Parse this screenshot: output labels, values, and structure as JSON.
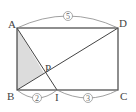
{
  "diagram": {
    "type": "geometry",
    "shape": "rectangle",
    "vertices": {
      "A": {
        "label": "A",
        "x": 17,
        "y": 28
      },
      "D": {
        "label": "D",
        "x": 118,
        "y": 28
      },
      "B": {
        "label": "B",
        "x": 17,
        "y": 90
      },
      "C": {
        "label": "C",
        "x": 118,
        "y": 90
      },
      "I": {
        "label": "I",
        "x": 57,
        "y": 90
      },
      "P": {
        "label": "P",
        "x": 44,
        "y": 73
      }
    },
    "segments": [
      "AD",
      "DC",
      "CB",
      "BA",
      "BD",
      "AI"
    ],
    "shaded_region": "triangle ABP",
    "shade_color": "#d9d9d9",
    "line_color": "#444444",
    "annotations": {
      "AD": "5",
      "BI": "2",
      "IC": "3"
    }
  }
}
